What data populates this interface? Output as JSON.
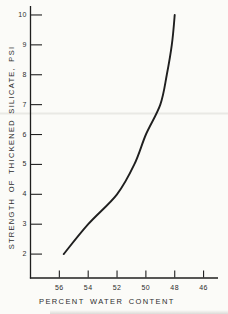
{
  "figure": {
    "colors": {
      "background": "#fbfbf8",
      "ink": "#1f1f1f",
      "text": "#2d2d2d",
      "artifact": "#e7e7e2"
    }
  },
  "chart_data": {
    "type": "line",
    "title": "",
    "xlabel": "PERCENT WATER CONTENT",
    "ylabel": "STRENGTH OF THICKENED SILICATE, PSI",
    "x_ticks": [
      56,
      54,
      52,
      50,
      48,
      46
    ],
    "y_ticks": [
      2,
      3,
      4,
      5,
      6,
      7,
      8,
      9,
      10
    ],
    "xlim": [
      58,
      45
    ],
    "x_axis_reversed": true,
    "ylim": [
      1.2,
      10.3
    ],
    "grid": false,
    "legend": "none",
    "series": [
      {
        "name": "strength-vs-water-content",
        "points": [
          {
            "x": 55.7,
            "y": 2.0
          },
          {
            "x": 54.0,
            "y": 3.0
          },
          {
            "x": 52.0,
            "y": 4.0
          },
          {
            "x": 50.8,
            "y": 5.0
          },
          {
            "x": 50.0,
            "y": 6.0
          },
          {
            "x": 49.0,
            "y": 7.0
          },
          {
            "x": 48.55,
            "y": 8.0
          },
          {
            "x": 48.2,
            "y": 9.0
          },
          {
            "x": 48.0,
            "y": 10.0
          }
        ]
      }
    ]
  }
}
